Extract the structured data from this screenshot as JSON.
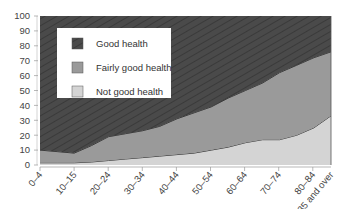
{
  "chart_data": {
    "type": "area",
    "stacked": true,
    "title": "",
    "xlabel": "",
    "ylabel": "",
    "ylim": [
      0,
      100
    ],
    "yticks": [
      0,
      10,
      20,
      30,
      40,
      50,
      60,
      70,
      80,
      90,
      100
    ],
    "grid": false,
    "legend_position": "upper-left-inside",
    "categories": [
      "0–4",
      "5–9",
      "10–15",
      "16–19",
      "20–24",
      "25–29",
      "30–34",
      "35–39",
      "40–44",
      "45–49",
      "50–54",
      "55–59",
      "60–64",
      "65–69",
      "70–74",
      "75–79",
      "80–84",
      "85 and over"
    ],
    "tick_labels": [
      "0–4",
      "10–15",
      "20–24",
      "30–34",
      "40–44",
      "50–54",
      "60–64",
      "70–74",
      "80–84",
      "85 and over"
    ],
    "series": [
      {
        "name": "Not good health",
        "color": "#d4d4d4",
        "values": [
          1.5,
          1.5,
          1.5,
          2,
          3,
          4,
          5,
          6,
          7,
          8,
          10,
          12,
          15,
          17,
          17,
          20,
          25,
          33
        ]
      },
      {
        "name": "Fairly good health",
        "color": "#9a9a9a",
        "values": [
          8.5,
          7.5,
          6.5,
          11,
          16,
          17,
          18,
          20,
          24,
          27,
          29,
          33,
          35,
          38,
          45,
          47,
          47,
          43
        ]
      },
      {
        "name": "Good health",
        "color": "#4a4a4a",
        "values": [
          90,
          91,
          92,
          87,
          81,
          79,
          77,
          74,
          69,
          65,
          61,
          55,
          50,
          45,
          38,
          33,
          28,
          24
        ]
      }
    ]
  },
  "legend": {
    "items": [
      {
        "label": "Good health",
        "color": "#4a4a4a"
      },
      {
        "label": "Fairly good health",
        "color": "#9a9a9a"
      },
      {
        "label": "Not good health",
        "color": "#d4d4d4"
      }
    ]
  }
}
